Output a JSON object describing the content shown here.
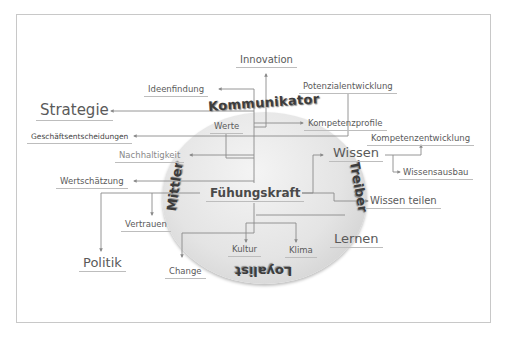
{
  "diagram": {
    "center": "Fühungskraft",
    "roles": {
      "top": "Kommunikator",
      "left": "Mittler",
      "right": "Treiber",
      "bottom": "Loyalist"
    },
    "labels": {
      "innovation": "Innovation",
      "ideenfindung": "Ideenfindung",
      "potenzialentwicklung": "Potenzialentwicklung",
      "strategie": "Strategie",
      "kompetenzprofile": "Kompetenzprofile",
      "werte": "Werte",
      "geschaeftsentscheidungen": "Geschäftsentscheidungen",
      "kompetenzentwicklung": "Kompetenzentwicklung",
      "nachhaltigkeit": "Nachhaltigkeit",
      "wissen": "Wissen",
      "wissensausbau": "Wissensausbau",
      "wertschaetzung": "Wertschätzung",
      "wissen_teilen": "Wissen teilen",
      "vertrauen": "Vertrauen",
      "lernen": "Lernen",
      "kultur": "Kultur",
      "klima": "Klima",
      "politik": "Politik",
      "change": "Change"
    },
    "colors": {
      "text": "#5a5a5a",
      "line": "#8a8a8a",
      "circle": "#e0e0e0",
      "frame": "#c8c8c8"
    }
  }
}
